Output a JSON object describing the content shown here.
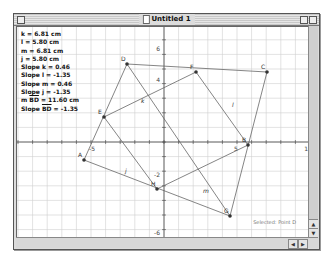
{
  "window": {
    "title": "Untitled 1",
    "status": "Selected: Point D"
  },
  "measurements": [
    {
      "label": "k = 6.81 cm"
    },
    {
      "label": "l = 5.80 cm"
    },
    {
      "label": "m = 6.81 cm"
    },
    {
      "label": "j = 5.80 cm"
    },
    {
      "label": "Slope k = 0.46"
    },
    {
      "label": "Slope l = -1.35"
    },
    {
      "label": "Slope m = 0.46"
    },
    {
      "label": "Slope j = -1.35"
    }
  ],
  "segment_measurements": [
    {
      "prefix": "m ",
      "segment": "BD",
      "suffix": " = 11.60 cm"
    },
    {
      "prefix": "Slope ",
      "segment": "BD",
      "suffix": " = -1.35"
    }
  ],
  "axes": {
    "x_ticks": [
      {
        "value": "-5",
        "x": 75
      },
      {
        "value": "5",
        "x": 219
      },
      {
        "value": "10",
        "x": 291
      }
    ],
    "y_ticks": [
      {
        "value": "6",
        "y": 22
      },
      {
        "value": "4",
        "y": 53
      },
      {
        "value": "-2",
        "y": 148
      },
      {
        "value": "-6",
        "y": 206
      }
    ]
  },
  "points": [
    {
      "name": "D",
      "x": 110,
      "y": 37
    },
    {
      "name": "F",
      "x": 179,
      "y": 45
    },
    {
      "name": "C",
      "x": 250,
      "y": 45
    },
    {
      "name": "E",
      "x": 87,
      "y": 90
    },
    {
      "name": "B",
      "x": 231,
      "y": 118
    },
    {
      "name": "A",
      "x": 67,
      "y": 133
    },
    {
      "name": "H",
      "x": 140,
      "y": 162
    },
    {
      "name": "G",
      "x": 213,
      "y": 189
    }
  ],
  "line_labels": [
    {
      "name": "k",
      "x": 124,
      "y": 76
    },
    {
      "name": "l",
      "x": 215,
      "y": 80
    },
    {
      "name": "j",
      "x": 108,
      "y": 146
    },
    {
      "name": "m",
      "x": 186,
      "y": 166
    }
  ],
  "scroll": {
    "up": "▲",
    "down": "▼",
    "left": "◀",
    "right": "▶"
  }
}
